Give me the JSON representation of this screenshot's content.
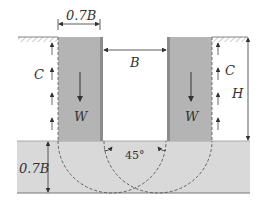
{
  "diagram": {
    "title": "",
    "labels": {
      "wall_width": "0.7B",
      "gap_width": "B",
      "cohesion_left": "C",
      "cohesion_right": "C",
      "weight_left": "W",
      "weight_right": "W",
      "height": "H",
      "slab_depth": "0.7B",
      "angle": "45°"
    },
    "colors": {
      "wall_fill": "#b4b4b4",
      "wall_edge": "#8c8c8c",
      "slab_fill": "#d9d9d9",
      "line": "#333333",
      "background": "#ffffff"
    }
  }
}
